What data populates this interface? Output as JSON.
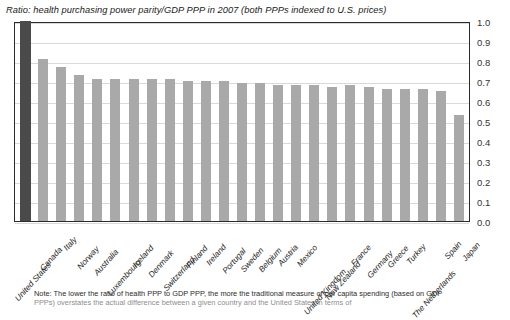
{
  "chart_data": {
    "type": "bar",
    "title": "Ratio: health purchasing power parity/GDP PPP in 2007 (both PPPs indexed to U.S. prices)",
    "xlabel": "",
    "ylabel": "",
    "ylim": [
      0.0,
      1.0
    ],
    "ytick_step": 0.1,
    "grid": true,
    "legend": "none",
    "highlight_category": "United States",
    "highlight_color": "#4a4a4a",
    "bar_color": "#a9a9a9",
    "categories": [
      "United States",
      "Canada",
      "Italy",
      "Norway",
      "Australia",
      "Luxembourg",
      "Iceland",
      "Denmark",
      "Switzerland",
      "Finland",
      "Ireland",
      "Portugal",
      "Sweden",
      "Belgium",
      "Austria",
      "Mexico",
      "United Kingdom",
      "New Zealand",
      "France",
      "Germany",
      "Greece",
      "Turkey",
      "The Netherlands",
      "Spain",
      "Japan"
    ],
    "values": [
      1.0,
      0.81,
      0.77,
      0.73,
      0.71,
      0.71,
      0.71,
      0.71,
      0.71,
      0.7,
      0.7,
      0.7,
      0.69,
      0.69,
      0.68,
      0.68,
      0.68,
      0.67,
      0.68,
      0.67,
      0.66,
      0.66,
      0.66,
      0.65,
      0.53
    ],
    "ytick_labels": [
      "1.0",
      "0.9",
      "0.8",
      "0.7",
      "0.6",
      "0.5",
      "0.4",
      "0.3",
      "0.2",
      "0.1",
      "0.0"
    ]
  },
  "note": {
    "line1": "Note: The lower the ratio of health PPP to GDP PPP, the more the traditional measure of per capita spending (based on GDP",
    "line2": "PPPs) overstates the actual difference between a given country and the United States in terms of"
  }
}
